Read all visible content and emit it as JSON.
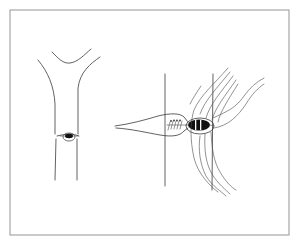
{
  "figure": {
    "type": "line-drawing",
    "colors": {
      "background": "#ffffff",
      "frame": "#8a8a8a",
      "line": "#3a3a3a",
      "fill_dark": "#111111"
    },
    "panels": [
      {
        "id": "left",
        "label": "",
        "elements": [
          "branching-tube",
          "junction-knot"
        ]
      },
      {
        "id": "right",
        "label": "",
        "elements": [
          "vertical-line-left",
          "vertical-line-right",
          "spindle-tube",
          "suture-stitches",
          "striped-knot",
          "fiber-bundle"
        ]
      }
    ]
  }
}
